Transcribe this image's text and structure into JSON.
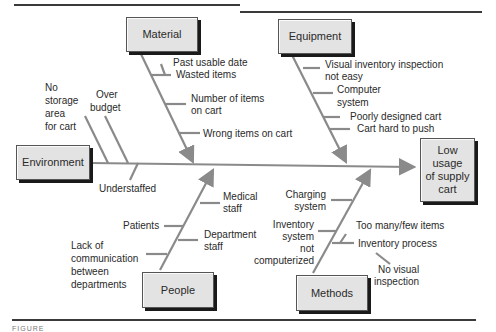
{
  "diagram": {
    "type": "fishbone",
    "effect": "Low\nusage\nof supply\ncart",
    "effect_lines": [
      "Low",
      "usage",
      "of supply",
      "cart"
    ],
    "categories": {
      "material": {
        "label": "Material",
        "causes": [
          "Past usable date",
          "Wasted items",
          "Number of items",
          "on cart",
          "Wrong items on cart"
        ]
      },
      "equipment": {
        "label": "Equipment",
        "causes": [
          "Visual inventory inspection",
          "not easy",
          "Computer",
          "system",
          "Poorly designed cart",
          "Cart hard to push"
        ]
      },
      "environment": {
        "label": "Environment",
        "causes": [
          "No",
          "storage",
          "area",
          "for cart",
          "Over",
          "budget",
          "Understaffed"
        ]
      },
      "people": {
        "label": "People",
        "causes": [
          "Medical",
          "staff",
          "Patients",
          "Department",
          "staff",
          "Lack of",
          "communication",
          "between",
          "departments"
        ]
      },
      "methods": {
        "label": "Methods",
        "causes": [
          "Charging",
          "system",
          "Inventory",
          "system",
          "not",
          "computerized",
          "Too many/few items",
          "Inventory process",
          "No visual",
          "inspection"
        ]
      }
    },
    "colors": {
      "bone": "#8a8a8a",
      "box_fill": "#e3e3e3",
      "box_shadow": "#1a1a1a",
      "text": "#2a2a2a"
    }
  },
  "caption": "FIGURE"
}
